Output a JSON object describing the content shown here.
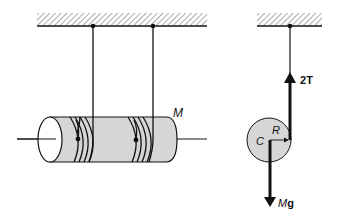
{
  "diagram": {
    "left_figure": {
      "mass_label": "M",
      "description": "Cylinder of mass M suspended by two strings wrapped around it"
    },
    "right_figure": {
      "center_label": "C",
      "radius_label": "R",
      "tension_label_prefix": "2",
      "tension_label_symbol": "T",
      "weight_label_prefix": "M",
      "weight_label_symbol": "g",
      "description": "Free-body diagram: tension 2T upward at radius R, weight Mg downward at center C"
    }
  },
  "colors": {
    "ink": "#111111",
    "cylinder_fill": "#d6d6d6",
    "end_face_fill": "#ffffff",
    "hatch": "#555555"
  }
}
